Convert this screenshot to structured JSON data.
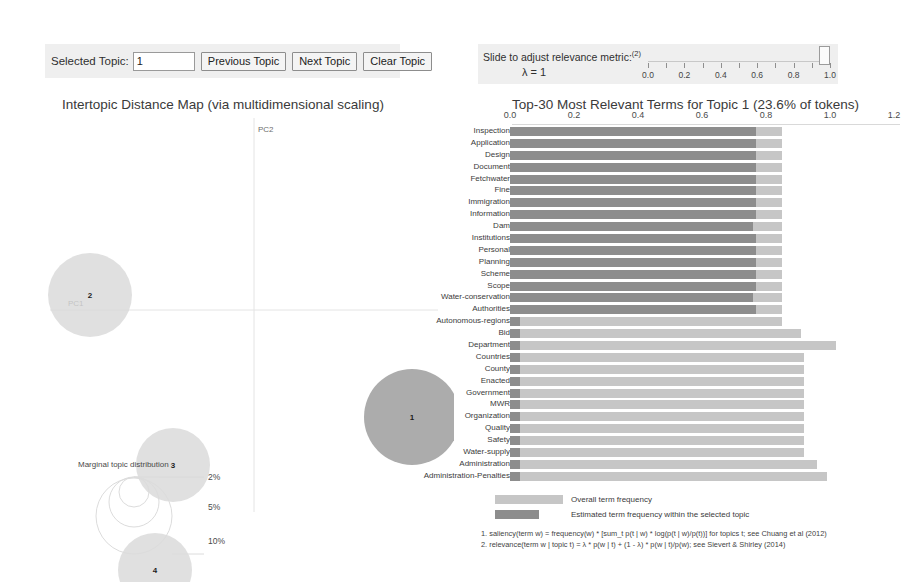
{
  "controls": {
    "selected_topic_label": "Selected Topic:",
    "selected_topic_value": "1",
    "previous_topic": "Previous Topic",
    "next_topic": "Next Topic",
    "clear_topic": "Clear Topic"
  },
  "slider": {
    "title": "Slide to adjust relevance metric:",
    "title_superscript": "(2)",
    "lambda_label": "λ = 1",
    "lambda_value": 1.0,
    "min": 0.0,
    "max": 1.0,
    "ticks": [
      "0.0",
      "0.2",
      "0.4",
      "0.6",
      "0.8",
      "1.0"
    ],
    "minor_tick_count": 11
  },
  "mds": {
    "title": "Intertopic Distance Map (via multidimensional scaling)",
    "axis_x_label": "PC1",
    "axis_y_label": "PC2",
    "marginal_label": "Marginal topic distribution",
    "size_legend": [
      "2%",
      "5%",
      "10%"
    ],
    "topics": [
      {
        "id": "1",
        "cx": 404,
        "cy": 305,
        "r": 48,
        "selected": true
      },
      {
        "id": "2",
        "cx": 82,
        "cy": 183,
        "r": 42,
        "selected": false
      },
      {
        "id": "3",
        "cx": 165,
        "cy": 353,
        "r": 37,
        "selected": false
      },
      {
        "id": "4",
        "cx": 147,
        "cy": 458,
        "r": 37,
        "selected": false
      }
    ]
  },
  "chart_data": {
    "type": "bar",
    "title": "Top-30 Most Relevant Terms for Topic 1 (23.6% of tokens)",
    "orientation": "horizontal",
    "xlabel": "",
    "ylabel": "",
    "xlim": [
      0.0,
      1.25
    ],
    "xticks": [
      "0.0",
      "0.2",
      "0.4",
      "0.6",
      "0.8",
      "1.0",
      "1.2"
    ],
    "xtick_values": [
      0.0,
      0.2,
      0.4,
      0.6,
      0.8,
      1.0,
      1.2
    ],
    "grid": false,
    "legend_position": "bottom",
    "categories": [
      "Inspection",
      "Application",
      "Design",
      "Document",
      "Fetchwater",
      "Fine",
      "Immigration",
      "Information",
      "Dam",
      "Institutions",
      "Personal",
      "Planning",
      "Scheme",
      "Scope",
      "Water-conservation",
      "Authorities",
      "Autonomous-regions",
      "Bid",
      "Department",
      "Countries",
      "County",
      "Enacted",
      "Government",
      "MWR",
      "Organization",
      "Quality",
      "Safety",
      "Water-supply",
      "Administration",
      "Administration-Penalties"
    ],
    "series": [
      {
        "name": "Overall term frequency",
        "color": "#c6c6c6",
        "values": [
          0.85,
          0.85,
          0.85,
          0.85,
          0.85,
          0.85,
          0.85,
          0.85,
          0.85,
          0.85,
          0.85,
          0.85,
          0.85,
          0.85,
          0.85,
          0.85,
          0.85,
          0.91,
          1.02,
          0.92,
          0.92,
          0.92,
          0.92,
          0.92,
          0.92,
          0.92,
          0.92,
          0.92,
          0.96,
          0.99
        ]
      },
      {
        "name": "Estimated term frequency within the selected topic",
        "color": "#8d8d8d",
        "values": [
          0.77,
          0.77,
          0.77,
          0.77,
          0.77,
          0.77,
          0.77,
          0.77,
          0.76,
          0.77,
          0.77,
          0.77,
          0.77,
          0.77,
          0.76,
          0.77,
          0.03,
          0.03,
          0.03,
          0.03,
          0.03,
          0.03,
          0.03,
          0.03,
          0.03,
          0.03,
          0.03,
          0.03,
          0.03,
          0.03
        ]
      }
    ],
    "legend": [
      {
        "label": "Overall term frequency",
        "color": "#c6c6c6"
      },
      {
        "label": "Estimated term frequency within the selected topic",
        "color": "#8d8d8d"
      }
    ],
    "notes": [
      "1. saliency(term w) = frequency(w) * [sum_t p(t | w) * log(p(t | w)/p(t))] for topics t; see Chuang et al (2012)",
      "2. relevance(term w | topic t) = λ * p(w | t) + (1 - λ) * p(w | t)/p(w); see Sievert & Shirley (2014)"
    ]
  },
  "colors": {
    "panel_bg": "#efefef",
    "overall_bar": "#c6c6c6",
    "topic_bar": "#8d8d8d",
    "selected_topic_bar": "#6e6e6e",
    "circle_fill": "#d8d8d8",
    "selected_circle_fill": "#a8a8a8"
  }
}
